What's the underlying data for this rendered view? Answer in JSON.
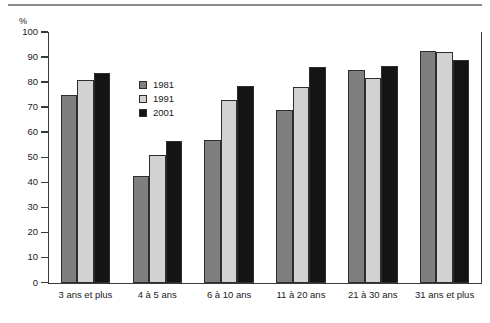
{
  "chart_data": {
    "type": "bar",
    "title": "",
    "subtitle": "",
    "xlabel": "",
    "ylabel": "%",
    "ylim": [
      0,
      100
    ],
    "ytick_step": 10,
    "yticks": [
      "100",
      "90",
      "80",
      "70",
      "60",
      "50",
      "40",
      "30",
      "20",
      "10",
      "0"
    ],
    "grid": false,
    "legend_position": "inside-upper-left",
    "categories": [
      "3 ans et plus",
      "4 à 5 ans",
      "6 à 10 ans",
      "11 à 20 ans",
      "21 à 30 ans",
      "31 ans et plus"
    ],
    "series": [
      {
        "name": "1981",
        "color": "#7f7f7f",
        "values": [
          75,
          42.5,
          57,
          69,
          85,
          92.5
        ]
      },
      {
        "name": "1991",
        "color": "#d2d2d2",
        "values": [
          81,
          51,
          73,
          78,
          81.5,
          92
        ]
      },
      {
        "name": "2001",
        "color": "#141414",
        "values": [
          83.5,
          56.5,
          78.5,
          86,
          86.5,
          89
        ]
      }
    ]
  },
  "axis": {
    "unit_label": "%"
  },
  "legend": {
    "items": [
      {
        "label": "1981",
        "color": "#7f7f7f"
      },
      {
        "label": "1991",
        "color": "#d2d2d2"
      },
      {
        "label": "2001",
        "color": "#141414"
      }
    ]
  }
}
